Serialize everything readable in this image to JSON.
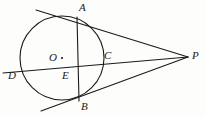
{
  "figure": {
    "background_color": "#fdfdfb",
    "stroke_color": "#1a1a1a",
    "label_color": "#1a1a1a"
  },
  "circle": {
    "name": "main-circle",
    "center_x": 62,
    "center_y": 58,
    "radius": 42,
    "center_label": "O",
    "center_dot_x": 62,
    "center_dot_y": 58
  },
  "points": [
    {
      "id": "A",
      "label": "A",
      "x": 77,
      "y": 17,
      "label_x": 79,
      "label_y": 2
    },
    {
      "id": "B",
      "label": "B",
      "x": 79,
      "y": 101,
      "label_x": 81,
      "label_y": 101
    },
    {
      "id": "C",
      "label": "C",
      "x": 103,
      "y": 62,
      "label_x": 104,
      "label_y": 50
    },
    {
      "id": "D",
      "label": "D",
      "x": 22,
      "y": 72,
      "label_x": 8,
      "label_y": 70
    },
    {
      "id": "E",
      "label": "E",
      "x": 65,
      "y": 69,
      "label_x": 62,
      "label_y": 70
    },
    {
      "id": "O",
      "label": "O",
      "x": 62,
      "y": 58,
      "label_x": 49,
      "label_y": 52
    },
    {
      "id": "P",
      "label": "P",
      "x": 188,
      "y": 57,
      "label_x": 192,
      "label_y": 50
    }
  ],
  "segments": [
    {
      "id": "tangent-PA",
      "from": "A-extended",
      "to": "P",
      "x1": 36,
      "y1": 10,
      "x2": 188,
      "y2": 57
    },
    {
      "id": "tangent-PB",
      "from": "B-extended",
      "to": "P",
      "x1": 41,
      "y1": 111,
      "x2": 188,
      "y2": 57
    },
    {
      "id": "secant-DP",
      "from": "D-extended",
      "to": "P",
      "x1": 3,
      "y1": 73,
      "x2": 188,
      "y2": 57
    },
    {
      "id": "chord-AB",
      "from": "A",
      "to": "B",
      "x1": 77,
      "y1": 17,
      "x2": 79,
      "y2": 101
    }
  ],
  "stroke_width": 1.1
}
